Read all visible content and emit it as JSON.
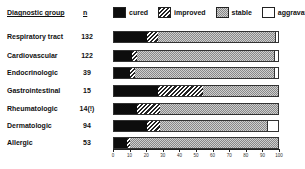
{
  "chart_data": {
    "type": "bar",
    "orientation": "horizontal",
    "stacked": true,
    "title": "",
    "xlabel": "",
    "ylabel": "Diagnostic group",
    "xlim": [
      0,
      100
    ],
    "x_ticks": [
      "0",
      "10",
      "20",
      "30",
      "40",
      "50",
      "60",
      "70",
      "80",
      "90",
      "100"
    ],
    "grid": false,
    "legend_position": "top",
    "columns": {
      "group": "Diagnostic group",
      "n": "n"
    },
    "categories": [
      "Respiratory tract",
      "Cardiovascular",
      "Endocrinologic",
      "Gastrointestinal",
      "Rheumatologic",
      "Dermatologic",
      "Allergic"
    ],
    "n": [
      "132",
      "122",
      "39",
      "15",
      "14(!)",
      "94",
      "53"
    ],
    "series": [
      {
        "name": "cured",
        "values": [
          20,
          11,
          10,
          27,
          14,
          20,
          8
        ]
      },
      {
        "name": "improved",
        "values": [
          7,
          3,
          3,
          27,
          14,
          8,
          2
        ]
      },
      {
        "name": "stable",
        "values": [
          72,
          84,
          85,
          46,
          72,
          66,
          90
        ]
      },
      {
        "name": "aggravated",
        "values": [
          1,
          2,
          2,
          0,
          0,
          6,
          0
        ]
      }
    ]
  },
  "header": {
    "group": "Diagnostic group",
    "n": "n"
  },
  "legend": {
    "cured": "cured",
    "improved": "improved",
    "stable": "stable",
    "aggravated": "aggravated"
  },
  "rows": [
    {
      "label": "Respiratory tract",
      "n": "132"
    },
    {
      "label": "Cardiovascular",
      "n": "122"
    },
    {
      "label": "Endocrinologic",
      "n": "39"
    },
    {
      "label": "Gastrointestinal",
      "n": "15"
    },
    {
      "label": "Rheumatologic",
      "n": "14(!)"
    },
    {
      "label": "Dermatologic",
      "n": "94"
    },
    {
      "label": "Allergic",
      "n": "53"
    }
  ],
  "ticks": [
    "0",
    "10",
    "20",
    "30",
    "40",
    "50",
    "60",
    "70",
    "80",
    "90",
    "100"
  ]
}
